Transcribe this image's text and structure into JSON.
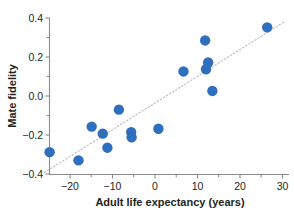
{
  "chart_data": {
    "type": "scatter",
    "title": "",
    "xlabel": "Adult life expectancy (years)",
    "ylabel": "Mate fidelity",
    "xlim": [
      -26.5,
      31.5
    ],
    "ylim": [
      -0.4,
      0.4
    ],
    "xticks": [
      -20,
      -10,
      0,
      10,
      20,
      30
    ],
    "xtick_labels": [
      "−20",
      "−10",
      "0",
      "10",
      "20",
      "30"
    ],
    "yticks": [
      -0.4,
      -0.2,
      0.0,
      0.2,
      0.4
    ],
    "ytick_labels": [
      "−0.4",
      "−0.2",
      "0.0",
      "0.2",
      "0.4"
    ],
    "xminor_ticks": [
      -25,
      -15,
      -5,
      5,
      15,
      25
    ],
    "yminor_ticks": [
      -0.3,
      -0.1,
      0.1,
      0.3
    ],
    "grid": false,
    "legend": false,
    "legend_position": "none",
    "marker_color": "#2f6fbe",
    "marker_size": 5.2,
    "trendline": {
      "type": "linear",
      "style": "dotted",
      "color": "#b9bcbe",
      "x_start": -26.0,
      "y_start": -0.392,
      "x_end": 30.6,
      "y_end": 0.383
    },
    "points": [
      {
        "x": -24.8,
        "y": -0.288
      },
      {
        "x": -18.0,
        "y": -0.33
      },
      {
        "x": -14.9,
        "y": -0.157
      },
      {
        "x": -12.3,
        "y": -0.193
      },
      {
        "x": -11.2,
        "y": -0.265
      },
      {
        "x": -8.5,
        "y": -0.07
      },
      {
        "x": -5.6,
        "y": -0.185
      },
      {
        "x": -5.5,
        "y": -0.212
      },
      {
        "x": 0.8,
        "y": -0.168
      },
      {
        "x": 6.7,
        "y": 0.126
      },
      {
        "x": 11.8,
        "y": 0.285
      },
      {
        "x": 12.0,
        "y": 0.137
      },
      {
        "x": 12.5,
        "y": 0.172
      },
      {
        "x": 13.5,
        "y": 0.026
      },
      {
        "x": 26.4,
        "y": 0.352
      }
    ],
    "point_count": 15
  },
  "axes": {
    "x_title": "Adult life expectancy (years)",
    "y_title": "Mate fidelity",
    "x_tick_0": "−20",
    "x_tick_1": "−10",
    "x_tick_2": "0",
    "x_tick_3": "10",
    "x_tick_4": "20",
    "x_tick_5": "30",
    "y_tick_0": "0.4",
    "y_tick_1": "0.2",
    "y_tick_2": "0.0",
    "y_tick_3": "−0.2",
    "y_tick_4": "−0.4"
  }
}
